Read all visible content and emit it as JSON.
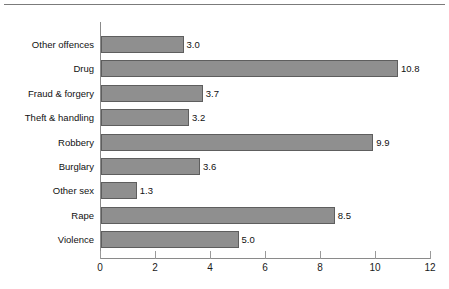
{
  "chart_data": {
    "type": "bar",
    "orientation": "horizontal",
    "title": "",
    "xlabel": "",
    "ylabel": "",
    "xlim": [
      0,
      12
    ],
    "xticks": [
      0,
      2,
      4,
      6,
      8,
      10,
      12
    ],
    "xtick_labels": [
      "0",
      "2",
      "4",
      "6",
      "8",
      "10",
      "12"
    ],
    "grid": false,
    "legend": false,
    "bar_color": "#8f8f8f",
    "bar_edge_color": "#5e5e5e",
    "categories": [
      "Other offences",
      "Drug",
      "Fraud & forgery",
      "Theft & handling",
      "Robbery",
      "Burglary",
      "Other sex",
      "Rape",
      "Violence"
    ],
    "values": [
      3.0,
      10.8,
      3.7,
      3.2,
      9.9,
      3.6,
      1.3,
      8.5,
      5.0
    ],
    "value_labels": [
      "3.0",
      "10.8",
      "3.7",
      "3.2",
      "9.9",
      "3.6",
      "1.3",
      "8.5",
      "5.0"
    ]
  }
}
